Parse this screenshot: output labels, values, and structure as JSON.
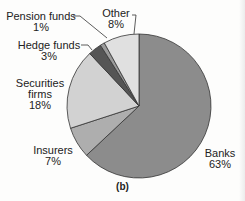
{
  "chart_data": {
    "type": "pie",
    "title": "",
    "caption": "(b)",
    "slices": [
      {
        "label": "Banks",
        "value": 63,
        "value_label": "63%",
        "color": "#8c8c8c"
      },
      {
        "label": "Insurers",
        "value": 7,
        "value_label": "7%",
        "color": "#aeaeae"
      },
      {
        "label": "Securities firms",
        "value": 18,
        "value_label": "18%",
        "color": "#d2d2d2"
      },
      {
        "label": "Hedge funds",
        "value": 3,
        "value_label": "3%",
        "color": "#555555"
      },
      {
        "label": "Pension funds",
        "value": 1,
        "value_label": "1%",
        "color": "#9a9a9a"
      },
      {
        "label": "Other",
        "value": 8,
        "value_label": "8%",
        "color": "#e0e0e0"
      }
    ],
    "start_angle_deg": 0,
    "direction": "clockwise"
  },
  "labels": {
    "banks": {
      "name": "Banks",
      "pct": "63%"
    },
    "insurers": {
      "name": "Insurers",
      "pct": "7%"
    },
    "securities": {
      "name1": "Securities",
      "name2": "firms",
      "pct": "18%"
    },
    "hedge": {
      "name": "Hedge funds",
      "pct": "3%"
    },
    "pension": {
      "name": "Pension funds",
      "pct": "1%"
    },
    "other": {
      "name": "Other",
      "pct": "8%"
    }
  },
  "caption": "(b)"
}
